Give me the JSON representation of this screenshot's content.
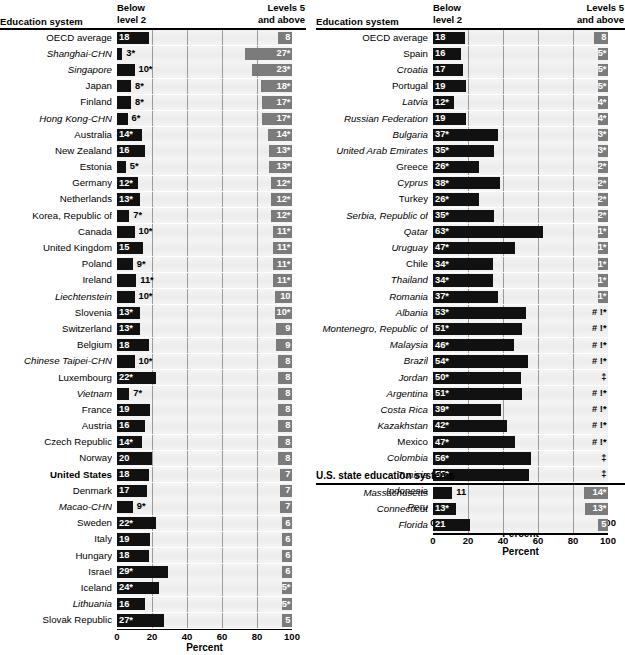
{
  "headers": {
    "education_system": "Education system",
    "below_level_2": "Below\nlevel 2",
    "below_level_2_l1": "Below",
    "below_level_2_l2": "level 2",
    "levels_5_l1": "Levels 5",
    "levels_5_l2": "and above",
    "states_section": "U.S. state education systems"
  },
  "axis": {
    "ticks": [
      "0",
      "20",
      "40",
      "60",
      "80",
      "100"
    ],
    "tick_values": [
      0,
      20,
      40,
      60,
      80,
      100
    ],
    "title": "Percent",
    "min": 0,
    "max": 100
  },
  "colors": {
    "below_bar": "#111111",
    "levels5_bar": "#7b7b7b",
    "plot_background": "#f0f0f0",
    "gridline": "#9a9a9a",
    "rule": "#000000"
  },
  "chart_data": {
    "type": "bar",
    "xlabel": "Percent",
    "ylabel": "Education system",
    "xlim": [
      0,
      100
    ],
    "grid": true,
    "legend_position": "column-headers",
    "series": [
      {
        "name": "Below level 2",
        "anchor": "left",
        "color": "#111111"
      },
      {
        "name": "Levels 5 and above",
        "anchor": "right",
        "color": "#7b7b7b"
      }
    ],
    "panels": [
      {
        "id": "left",
        "rows": [
          {
            "label": "OECD average",
            "style": "plain",
            "below": 18,
            "below_label": "18",
            "lev5": 8,
            "lev5_label": "8"
          },
          {
            "label": "Shanghai-CHN",
            "style": "italic",
            "below": 3,
            "below_label": "3*",
            "lev5": 27,
            "lev5_label": "27*"
          },
          {
            "label": "Singapore",
            "style": "italic",
            "below": 10,
            "below_label": "10*",
            "lev5": 23,
            "lev5_label": "23*"
          },
          {
            "label": "Japan",
            "style": "plain",
            "below": 8,
            "below_label": "8*",
            "lev5": 18,
            "lev5_label": "18*"
          },
          {
            "label": "Finland",
            "style": "plain",
            "below": 8,
            "below_label": "8*",
            "lev5": 17,
            "lev5_label": "17*"
          },
          {
            "label": "Hong Kong-CHN",
            "style": "italic",
            "below": 6,
            "below_label": "6*",
            "lev5": 17,
            "lev5_label": "17*"
          },
          {
            "label": "Australia",
            "style": "plain",
            "below": 14,
            "below_label": "14*",
            "lev5": 14,
            "lev5_label": "14*"
          },
          {
            "label": "New Zealand",
            "style": "plain",
            "below": 16,
            "below_label": "16",
            "lev5": 13,
            "lev5_label": "13*"
          },
          {
            "label": "Estonia",
            "style": "plain",
            "below": 5,
            "below_label": "5*",
            "lev5": 13,
            "lev5_label": "13*"
          },
          {
            "label": "Germany",
            "style": "plain",
            "below": 12,
            "below_label": "12*",
            "lev5": 12,
            "lev5_label": "12*"
          },
          {
            "label": "Netherlands",
            "style": "plain",
            "below": 13,
            "below_label": "13*",
            "lev5": 12,
            "lev5_label": "12*"
          },
          {
            "label": "Korea, Republic of",
            "style": "plain",
            "below": 7,
            "below_label": "7*",
            "lev5": 12,
            "lev5_label": "12*"
          },
          {
            "label": "Canada",
            "style": "plain",
            "below": 10,
            "below_label": "10*",
            "lev5": 11,
            "lev5_label": "11*"
          },
          {
            "label": "United Kingdom",
            "style": "plain",
            "below": 15,
            "below_label": "15",
            "lev5": 11,
            "lev5_label": "11*"
          },
          {
            "label": "Poland",
            "style": "plain",
            "below": 9,
            "below_label": "9*",
            "lev5": 11,
            "lev5_label": "11*"
          },
          {
            "label": "Ireland",
            "style": "plain",
            "below": 11,
            "below_label": "11*",
            "lev5": 11,
            "lev5_label": "11*"
          },
          {
            "label": "Liechtenstein",
            "style": "italic",
            "below": 10,
            "below_label": "10*",
            "lev5": 10,
            "lev5_label": "10"
          },
          {
            "label": "Slovenia",
            "style": "plain",
            "below": 13,
            "below_label": "13*",
            "lev5": 10,
            "lev5_label": "10*"
          },
          {
            "label": "Switzerland",
            "style": "plain",
            "below": 13,
            "below_label": "13*",
            "lev5": 9,
            "lev5_label": "9"
          },
          {
            "label": "Belgium",
            "style": "plain",
            "below": 18,
            "below_label": "18",
            "lev5": 9,
            "lev5_label": "9"
          },
          {
            "label": "Chinese Taipei-CHN",
            "style": "italic",
            "below": 10,
            "below_label": "10*",
            "lev5": 8,
            "lev5_label": "8"
          },
          {
            "label": "Luxembourg",
            "style": "plain",
            "below": 22,
            "below_label": "22*",
            "lev5": 8,
            "lev5_label": "8"
          },
          {
            "label": "Vietnam",
            "style": "italic",
            "below": 7,
            "below_label": "7*",
            "lev5": 8,
            "lev5_label": "8"
          },
          {
            "label": "France",
            "style": "plain",
            "below": 19,
            "below_label": "19",
            "lev5": 8,
            "lev5_label": "8"
          },
          {
            "label": "Austria",
            "style": "plain",
            "below": 16,
            "below_label": "16",
            "lev5": 8,
            "lev5_label": "8"
          },
          {
            "label": "Czech Republic",
            "style": "plain",
            "below": 14,
            "below_label": "14*",
            "lev5": 8,
            "lev5_label": "8"
          },
          {
            "label": "Norway",
            "style": "plain",
            "below": 20,
            "below_label": "20",
            "lev5": 8,
            "lev5_label": "8"
          },
          {
            "label": "United States",
            "style": "bold",
            "below": 18,
            "below_label": "18",
            "lev5": 7,
            "lev5_label": "7"
          },
          {
            "label": "Denmark",
            "style": "plain",
            "below": 17,
            "below_label": "17",
            "lev5": 7,
            "lev5_label": "7"
          },
          {
            "label": "Macao-CHN",
            "style": "italic",
            "below": 9,
            "below_label": "9*",
            "lev5": 7,
            "lev5_label": "7"
          },
          {
            "label": "Sweden",
            "style": "plain",
            "below": 22,
            "below_label": "22*",
            "lev5": 6,
            "lev5_label": "6"
          },
          {
            "label": "Italy",
            "style": "plain",
            "below": 19,
            "below_label": "19",
            "lev5": 6,
            "lev5_label": "6"
          },
          {
            "label": "Hungary",
            "style": "plain",
            "below": 18,
            "below_label": "18",
            "lev5": 6,
            "lev5_label": "6"
          },
          {
            "label": "Israel",
            "style": "plain",
            "below": 29,
            "below_label": "29*",
            "lev5": 6,
            "lev5_label": "6"
          },
          {
            "label": "Iceland",
            "style": "plain",
            "below": 24,
            "below_label": "24*",
            "lev5": 5,
            "lev5_label": "5*"
          },
          {
            "label": "Lithuania",
            "style": "italic",
            "below": 16,
            "below_label": "16",
            "lev5": 5,
            "lev5_label": "5*"
          },
          {
            "label": "Slovak Republic",
            "style": "plain",
            "below": 27,
            "below_label": "27*",
            "lev5": 5,
            "lev5_label": "5"
          }
        ]
      },
      {
        "id": "right",
        "rows": [
          {
            "label": "OECD average",
            "style": "plain",
            "below": 18,
            "below_label": "18",
            "lev5": 8,
            "lev5_label": "8"
          },
          {
            "label": "Spain",
            "style": "plain",
            "below": 16,
            "below_label": "16",
            "lev5": 5,
            "lev5_label": "5*"
          },
          {
            "label": "Croatia",
            "style": "italic",
            "below": 17,
            "below_label": "17",
            "lev5": 5,
            "lev5_label": "5*"
          },
          {
            "label": "Portugal",
            "style": "plain",
            "below": 19,
            "below_label": "19",
            "lev5": 5,
            "lev5_label": "5*"
          },
          {
            "label": "Latvia",
            "style": "italic",
            "below": 12,
            "below_label": "12*",
            "lev5": 4,
            "lev5_label": "4*"
          },
          {
            "label": "Russian Federation",
            "style": "italic",
            "below": 19,
            "below_label": "19",
            "lev5": 4,
            "lev5_label": "4*"
          },
          {
            "label": "Bulgaria",
            "style": "italic",
            "below": 37,
            "below_label": "37*",
            "lev5": 3,
            "lev5_label": "3*"
          },
          {
            "label": "United Arab Emirates",
            "style": "italic",
            "below": 35,
            "below_label": "35*",
            "lev5": 3,
            "lev5_label": "3*"
          },
          {
            "label": "Greece",
            "style": "plain",
            "below": 26,
            "below_label": "26*",
            "lev5": 2,
            "lev5_label": "2*"
          },
          {
            "label": "Cyprus",
            "style": "italic",
            "below": 38,
            "below_label": "38*",
            "lev5": 2,
            "lev5_label": "2*"
          },
          {
            "label": "Turkey",
            "style": "plain",
            "below": 26,
            "below_label": "26*",
            "lev5": 2,
            "lev5_label": "2*"
          },
          {
            "label": "Serbia, Republic of",
            "style": "italic",
            "below": 35,
            "below_label": "35*",
            "lev5": 2,
            "lev5_label": "2*"
          },
          {
            "label": "Qatar",
            "style": "italic",
            "below": 63,
            "below_label": "63*",
            "lev5": 1,
            "lev5_label": "1*"
          },
          {
            "label": "Uruguay",
            "style": "italic",
            "below": 47,
            "below_label": "47*",
            "lev5": 1,
            "lev5_label": "1*"
          },
          {
            "label": "Chile",
            "style": "plain",
            "below": 34,
            "below_label": "34*",
            "lev5": 1,
            "lev5_label": "1*"
          },
          {
            "label": "Thailand",
            "style": "italic",
            "below": 34,
            "below_label": "34*",
            "lev5": 1,
            "lev5_label": "1*"
          },
          {
            "label": "Romania",
            "style": "italic",
            "below": 37,
            "below_label": "37*",
            "lev5": 1,
            "lev5_label": "1*"
          },
          {
            "label": "Albania",
            "style": "italic",
            "below": 53,
            "below_label": "53*",
            "lev5": 0,
            "lev5_label": "# !*"
          },
          {
            "label": "Montenegro, Republic of",
            "style": "italic",
            "below": 51,
            "below_label": "51*",
            "lev5": 0,
            "lev5_label": "# !*"
          },
          {
            "label": "Malaysia",
            "style": "italic",
            "below": 46,
            "below_label": "46*",
            "lev5": 0,
            "lev5_label": "# !*"
          },
          {
            "label": "Brazil",
            "style": "italic",
            "below": 54,
            "below_label": "54*",
            "lev5": 0,
            "lev5_label": "# !*"
          },
          {
            "label": "Jordan",
            "style": "italic",
            "below": 50,
            "below_label": "50*",
            "lev5": 0,
            "lev5_label": "‡"
          },
          {
            "label": "Argentina",
            "style": "italic",
            "below": 51,
            "below_label": "51*",
            "lev5": 0,
            "lev5_label": "# !*"
          },
          {
            "label": "Costa Rica",
            "style": "italic",
            "below": 39,
            "below_label": "39*",
            "lev5": 0,
            "lev5_label": "# !*"
          },
          {
            "label": "Kazakhstan",
            "style": "italic",
            "below": 42,
            "below_label": "42*",
            "lev5": 0,
            "lev5_label": "# !*"
          },
          {
            "label": "Mexico",
            "style": "plain",
            "below": 47,
            "below_label": "47*",
            "lev5": 0,
            "lev5_label": "# !*"
          },
          {
            "label": "Colombia",
            "style": "italic",
            "below": 56,
            "below_label": "56*",
            "lev5": 0,
            "lev5_label": "‡"
          },
          {
            "label": "Tunisia",
            "style": "italic",
            "below": 55,
            "below_label": "55*",
            "lev5": 0,
            "lev5_label": "‡"
          },
          {
            "label": "Indonesia",
            "style": "italic",
            "below": 67,
            "below_label": "67*",
            "lev5": 0,
            "lev5_label": "‡"
          },
          {
            "label": "Peru",
            "style": "italic",
            "below": 68,
            "below_label": "68*",
            "lev5": 0,
            "lev5_label": "‡"
          }
        ]
      },
      {
        "id": "states",
        "rows": [
          {
            "label": "Massachusetts",
            "style": "italic",
            "below": 11,
            "below_label": "11",
            "lev5": 14,
            "lev5_label": "14*"
          },
          {
            "label": "Connecticut",
            "style": "italic",
            "below": 13,
            "below_label": "13*",
            "lev5": 13,
            "lev5_label": "13*"
          },
          {
            "label": "Florida",
            "style": "italic",
            "below": 21,
            "below_label": "21",
            "lev5": 5,
            "lev5_label": "5"
          }
        ]
      }
    ]
  }
}
